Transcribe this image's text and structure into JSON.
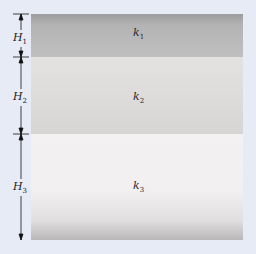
{
  "diagram": {
    "type": "layered-medium",
    "layers": [
      {
        "id": "layer-1",
        "conductivity_symbol": "k",
        "conductivity_index": "1",
        "thickness_symbol": "H",
        "thickness_index": "1"
      },
      {
        "id": "layer-2",
        "conductivity_symbol": "k",
        "conductivity_index": "2",
        "thickness_symbol": "H",
        "thickness_index": "2"
      },
      {
        "id": "layer-3",
        "conductivity_symbol": "k",
        "conductivity_index": "3",
        "thickness_symbol": "H",
        "thickness_index": "3"
      }
    ],
    "colors": {
      "background": "#e6ebf6",
      "layer_1": "#b4b3b3",
      "layer_2": "#dddbda",
      "layer_3": "#f1efef",
      "dimension_lines": "#111111"
    }
  }
}
